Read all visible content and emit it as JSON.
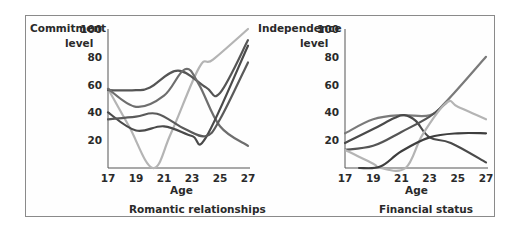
{
  "chart_data": [
    {
      "type": "line",
      "title": "Romantic relationships",
      "xlabel": "Age",
      "ylabel": "Commitment level",
      "x": [
        17,
        19,
        21,
        23,
        25,
        27
      ],
      "yticks": [
        20,
        40,
        60,
        80,
        100
      ],
      "ylim": [
        0,
        100
      ],
      "xlim": [
        17,
        27
      ],
      "grid": false,
      "series": [
        {
          "name": "line-a",
          "color": "#b4b4b4",
          "points": [
            [
              17,
              57
            ],
            [
              18.5,
              30
            ],
            [
              20.2,
              0
            ],
            [
              21.5,
              25
            ],
            [
              23.5,
              72
            ],
            [
              24.5,
              78
            ],
            [
              27,
              100
            ]
          ]
        },
        {
          "name": "line-b",
          "color": "#555555",
          "points": [
            [
              17,
              56
            ],
            [
              19,
              56
            ],
            [
              20,
              58
            ],
            [
              22,
              70
            ],
            [
              24,
              58
            ],
            [
              25,
              54
            ],
            [
              27,
              92
            ]
          ]
        },
        {
          "name": "line-c",
          "color": "#6e6e6e",
          "points": [
            [
              17,
              57
            ],
            [
              19,
              44
            ],
            [
              21,
              52
            ],
            [
              22.5,
              71
            ],
            [
              23.5,
              60
            ],
            [
              25,
              30
            ],
            [
              27,
              16
            ]
          ]
        },
        {
          "name": "line-d",
          "color": "#4a4a4a",
          "points": [
            [
              17,
              40
            ],
            [
              19,
              27
            ],
            [
              21,
              30
            ],
            [
              23,
              23
            ],
            [
              24,
              22
            ],
            [
              27,
              88
            ]
          ]
        },
        {
          "name": "line-e",
          "color": "#5a5a5a",
          "points": [
            [
              17,
              35
            ],
            [
              19,
              37
            ],
            [
              20.5,
              39
            ],
            [
              22.5,
              28
            ],
            [
              24,
              23
            ],
            [
              25,
              35
            ],
            [
              27,
              76
            ]
          ]
        }
      ]
    },
    {
      "type": "line",
      "title": "Financial status",
      "xlabel": "Age",
      "ylabel": "Independence level",
      "x": [
        17,
        19,
        21,
        23,
        25,
        27
      ],
      "yticks": [
        20,
        40,
        60,
        80,
        100
      ],
      "ylim": [
        0,
        100
      ],
      "xlim": [
        17,
        27
      ],
      "grid": false,
      "series": [
        {
          "name": "line-a",
          "color": "#7a7a7a",
          "points": [
            [
              17,
              25
            ],
            [
              19,
              35
            ],
            [
              21,
              38
            ],
            [
              23,
              38
            ],
            [
              24.2,
              48
            ],
            [
              27,
              80
            ]
          ]
        },
        {
          "name": "line-b",
          "color": "#4a4a4a",
          "points": [
            [
              17,
              18
            ],
            [
              19,
              28
            ],
            [
              20.5,
              36
            ],
            [
              21.2,
              38
            ],
            [
              22,
              34
            ],
            [
              23,
              22
            ],
            [
              24.5,
              18
            ],
            [
              27,
              4
            ]
          ]
        },
        {
          "name": "line-c",
          "color": "#555555",
          "points": [
            [
              17,
              13
            ],
            [
              19,
              16
            ],
            [
              21,
              26
            ],
            [
              23,
              37
            ],
            [
              24.2,
              47
            ]
          ]
        },
        {
          "name": "line-d",
          "color": "#b4b4b4",
          "points": [
            [
              17,
              13
            ],
            [
              19,
              3
            ],
            [
              19.5,
              0
            ],
            [
              21.3,
              0
            ],
            [
              22.5,
              24
            ],
            [
              24.2,
              47
            ],
            [
              25,
              44
            ],
            [
              27,
              35
            ]
          ]
        },
        {
          "name": "line-e",
          "color": "#3e3e3e",
          "points": [
            [
              18,
              0
            ],
            [
              19.5,
              1
            ],
            [
              21,
              12
            ],
            [
              23,
              22
            ],
            [
              25,
              25
            ],
            [
              27,
              25
            ]
          ]
        }
      ]
    }
  ],
  "charts": [
    {
      "ylabel_line1": "Commitment",
      "ylabel_line2": "level",
      "xlabel": "Age",
      "title": "Romantic relationships",
      "yticks": [
        "100",
        "80",
        "60",
        "40",
        "20"
      ],
      "xticks": [
        "17",
        "19",
        "21",
        "23",
        "25",
        "27"
      ]
    },
    {
      "ylabel_line1": "Independence",
      "ylabel_line2": "level",
      "xlabel": "Age",
      "title": "Financial status",
      "yticks": [
        "100",
        "80",
        "60",
        "40",
        "20"
      ],
      "xticks": [
        "17",
        "19",
        "21",
        "23",
        "25",
        "27"
      ]
    }
  ]
}
